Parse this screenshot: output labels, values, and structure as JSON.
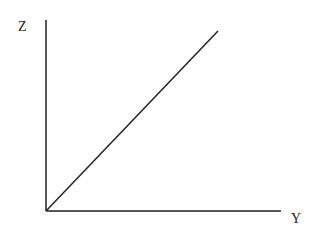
{
  "diagram": {
    "axes": {
      "vertical_label": "Z",
      "horizontal_label": "Y"
    },
    "line_color": "#222222",
    "origin": [
      46,
      211
    ],
    "vertical_axis_end": [
      46,
      20
    ],
    "horizontal_axis_end": [
      281,
      211
    ],
    "diagonal_end": [
      218,
      31
    ]
  }
}
